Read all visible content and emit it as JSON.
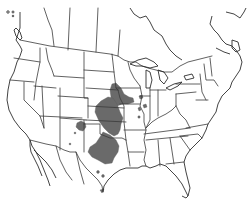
{
  "map": {
    "type": "species-range-map",
    "region": "North America (United States, southern Canada, northern Mexico)",
    "background_color": "#ffffff",
    "line_color": "#3a3a3a",
    "range_color": "#6a6a6a",
    "legend": null,
    "title": null,
    "range_areas": [
      {
        "name": "main-range-north",
        "description": "Southern Minnesota / Iowa / eastern South Dakota"
      },
      {
        "name": "main-range-central",
        "description": "Nebraska / Kansas"
      },
      {
        "name": "main-range-south",
        "description": "Oklahoma / north-central Texas"
      },
      {
        "name": "outlier-colorado",
        "description": "Southeastern Colorado patch"
      },
      {
        "name": "outlier-new-mexico",
        "description": "Small dots in New Mexico"
      },
      {
        "name": "outlier-illinois",
        "description": "Small patches in Illinois"
      },
      {
        "name": "outlier-missouri",
        "description": "Spot along Mississippi River"
      },
      {
        "name": "outlier-texas",
        "description": "Small dots in central and southern Texas"
      }
    ]
  }
}
